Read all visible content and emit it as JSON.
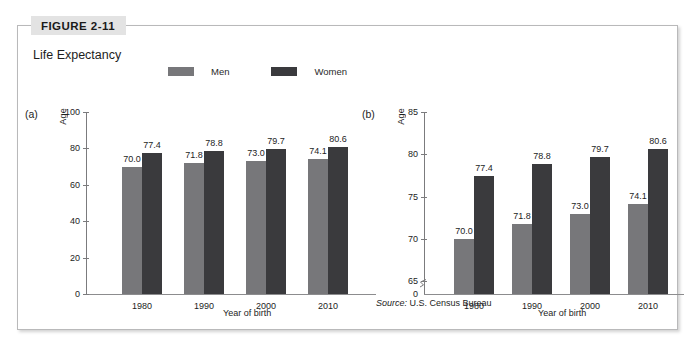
{
  "figure": {
    "tag": "FIGURE 2-11",
    "title": "Life Expectancy",
    "source_prefix": "Source:",
    "source_text": "U.S. Census Bureau"
  },
  "legend": {
    "items": [
      {
        "label": "Men",
        "color": "#77777a",
        "icon": "legend-swatch-men"
      },
      {
        "label": "Women",
        "color": "#3a3a3d",
        "icon": "legend-swatch-women"
      }
    ]
  },
  "panels": [
    {
      "letter": "(a)",
      "ylabel": "Age",
      "xlabel": "Year of birth"
    },
    {
      "letter": "(b)",
      "ylabel": "Age",
      "xlabel": "Year of birth"
    }
  ],
  "chart_data": [
    {
      "type": "bar",
      "panel": "(a)",
      "title": "Life Expectancy",
      "categories": [
        "1980",
        "1990",
        "2000",
        "2010"
      ],
      "series": [
        {
          "name": "Men",
          "values": [
            70.0,
            71.8,
            73.0,
            74.1
          ],
          "color": "#77777a"
        },
        {
          "name": "Women",
          "values": [
            77.4,
            78.8,
            79.7,
            80.6
          ],
          "color": "#3a3a3d"
        }
      ],
      "value_labels": [
        [
          "70.0",
          "77.4"
        ],
        [
          "71.8",
          "78.8"
        ],
        [
          "73.0",
          "79.7"
        ],
        [
          "74.1",
          "80.6"
        ]
      ],
      "xlabel": "Year of birth",
      "ylabel": "Age",
      "ylim": [
        0,
        100
      ],
      "yticks": [
        0,
        20,
        40,
        60,
        80,
        100
      ],
      "ytick_labels": [
        "0",
        "20",
        "40",
        "60",
        "80",
        "100"
      ],
      "grid": false,
      "axis_break": false,
      "legend_position": "top"
    },
    {
      "type": "bar",
      "panel": "(b)",
      "title": "Life Expectancy",
      "categories": [
        "1980",
        "1990",
        "2000",
        "2010"
      ],
      "series": [
        {
          "name": "Men",
          "values": [
            70.0,
            71.8,
            73.0,
            74.1
          ],
          "color": "#77777a"
        },
        {
          "name": "Women",
          "values": [
            77.4,
            78.8,
            79.7,
            80.6
          ],
          "color": "#3a3a3d"
        }
      ],
      "value_labels": [
        [
          "70.0",
          "77.4"
        ],
        [
          "71.8",
          "78.8"
        ],
        [
          "73.0",
          "79.7"
        ],
        [
          "74.1",
          "80.6"
        ]
      ],
      "xlabel": "Year of birth",
      "ylabel": "Age",
      "ylim": [
        63.5,
        85
      ],
      "yticks": [
        65,
        70,
        75,
        80,
        85
      ],
      "ytick_labels": [
        "65",
        "70",
        "75",
        "80",
        "85"
      ],
      "zero_tick_label": "0",
      "grid": false,
      "axis_break": true,
      "legend_position": "top"
    }
  ],
  "colors": {
    "men": "#77777a",
    "women": "#3a3a3d",
    "frame": "#b9b9ba",
    "tag_bg": "#e3e3e3",
    "axis": "#7b7b7d"
  }
}
